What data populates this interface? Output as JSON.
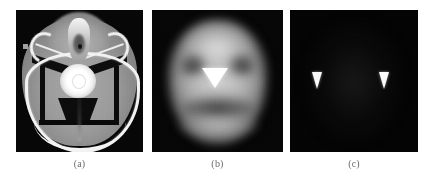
{
  "figure": {
    "background_color": "#ffffff",
    "panel_count": 3,
    "layout": "horizontal row of three square medical image panels with lettered captions beneath"
  },
  "panels": [
    {
      "caption": "(a)",
      "name": "ct-scan",
      "modality": "CT",
      "description": "Axial CT at the skull base showing bright calvarium, facial bones, a markedly hyperdense focus at midline centre and dark streak artifacts",
      "background_color": "#070707",
      "bone_color": "#f2f2f2",
      "soft_tissue_color": "#9a9a9a",
      "hot_spot_color": "#ffffff",
      "markers": []
    },
    {
      "caption": "(b)",
      "name": "functional-scan",
      "modality": "Functional / blurred emission image",
      "description": "Heavily blurred head-shaped uptake map with dark orbital regions and a bright white downward-pointing triangle marker at midline centre",
      "background_color": "#060606",
      "head_color": "#cfcfcf",
      "marker_color": "#ffffff",
      "markers": [
        {
          "shape": "triangle-down",
          "position": "center",
          "color": "#ffffff",
          "size": "large"
        }
      ]
    },
    {
      "caption": "(c)",
      "name": "subtraction-scan",
      "modality": "Subtraction / threshold map",
      "description": "Near-black image containing only two small white downward-pointing triangular markers, symmetric about the midline",
      "background_color": "#040404",
      "marker_color": "#fbfbfb",
      "markers": [
        {
          "shape": "triangle-down",
          "position": "left",
          "color": "#fbfbfb",
          "size": "small"
        },
        {
          "shape": "triangle-down",
          "position": "right",
          "color": "#fbfbfb",
          "size": "small"
        }
      ]
    }
  ],
  "captions": {
    "a": "(a)",
    "b": "(b)",
    "c": "(c)",
    "color": "#6b6b6b"
  }
}
